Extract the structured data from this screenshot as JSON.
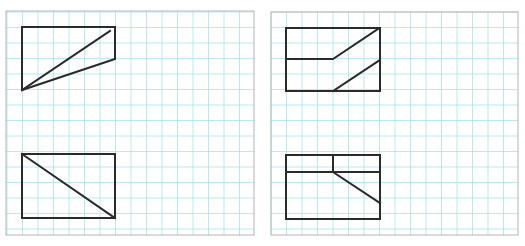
{
  "figure": {
    "background": "#ffffff",
    "grid_color": "#a8e4e6",
    "frame_color": "#b5b5b5",
    "stroke_color": "#2b2b2b",
    "grid_spacing": 15.5,
    "panels": [
      {
        "id": "left-panel",
        "frame": {
          "x": 6,
          "y": 11,
          "w": 248,
          "h": 224
        },
        "grid_origin": {
          "x": 7,
          "y": 12
        },
        "shapes": [
          {
            "id": "left-top-figure",
            "description": "rectangle top edge with right side cut, two lines from bottom-left apex",
            "paths": [
              "M22 27 L115 27 L115 59 L22 90 Z",
              "M22 90 L110 31"
            ]
          },
          {
            "id": "left-bottom-figure",
            "description": "rectangle with diagonal from top-left to bottom-right",
            "paths": [
              "M22 154 L115 154 L115 218 L22 218 Z",
              "M22 154 L115 218"
            ]
          }
        ]
      },
      {
        "id": "right-panel",
        "frame": {
          "x": 271,
          "y": 12,
          "w": 247,
          "h": 223
        },
        "grid_origin": {
          "x": 271,
          "y": 12
        },
        "shapes": [
          {
            "id": "right-top-figure",
            "description": "rectangle with stepped middle line and parallel diagonal",
            "paths": [
              "M286 28 L380 28 L380 91 L286 91 Z",
              "M286 59 L333 59 L378 29",
              "M333 91 L380 60"
            ]
          },
          {
            "id": "right-bottom-figure",
            "description": "rectangle with top strip split by vertical and diagonal",
            "paths": [
              "M286 155 L380 155 L380 219 L286 219 Z",
              "M286 172 L380 172",
              "M333 155 L333 172",
              "M333 172 L380 203"
            ]
          }
        ]
      }
    ]
  }
}
